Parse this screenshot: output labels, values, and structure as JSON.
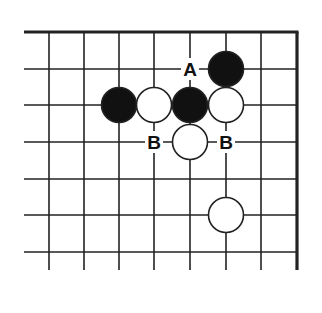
{
  "diagram": {
    "type": "go-board-corner",
    "colors": {
      "line": "#222222",
      "black_stone": "#111111",
      "white_stone": "#ffffff",
      "background": "#ffffff"
    },
    "grid": {
      "columns_x": [
        49,
        84,
        119,
        154,
        190,
        226,
        261
      ],
      "rows_y": [
        69,
        105,
        142,
        179,
        215,
        252
      ],
      "top_edge_y": 32,
      "right_edge_x": 297,
      "left_start_x": 24,
      "bottom_end_y": 270
    },
    "stones": [
      {
        "color": "black",
        "col": 5,
        "row": 0
      },
      {
        "color": "black",
        "col": 2,
        "row": 1
      },
      {
        "color": "white",
        "col": 3,
        "row": 1
      },
      {
        "color": "black",
        "col": 4,
        "row": 1
      },
      {
        "color": "white",
        "col": 5,
        "row": 1
      },
      {
        "color": "white",
        "col": 4,
        "row": 2
      },
      {
        "color": "white",
        "col": 5,
        "row": 4
      }
    ],
    "labels": [
      {
        "text": "A",
        "col": 4,
        "row": 0
      },
      {
        "text": "B",
        "col": 3,
        "row": 2
      },
      {
        "text": "B",
        "col": 5,
        "row": 2
      }
    ]
  }
}
